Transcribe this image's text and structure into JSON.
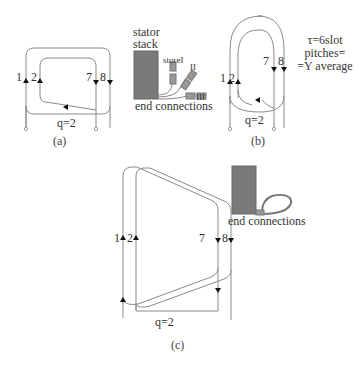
{
  "panel_a": {
    "caption": "(a)",
    "slot_labels": [
      "1",
      "2",
      "7",
      "8"
    ],
    "q_label": "q=2"
  },
  "stator_detail": {
    "title_line1": "stator",
    "title_line2": "stack",
    "store_labels": [
      "storeI",
      "II",
      "III"
    ],
    "end_connections_label": "end connections"
  },
  "panel_b": {
    "caption": "(b)",
    "slot_labels": [
      "1",
      "2",
      "7",
      "8"
    ],
    "q_label": "q=2",
    "note_line1": "τ=6slot",
    "note_line2": "pitches=",
    "note_line3": "=Y average"
  },
  "panel_c": {
    "caption": "(c)",
    "slot_labels": [
      "1",
      "2",
      "7",
      "8"
    ],
    "q_label": "q=2",
    "end_connections_label": "end connections"
  },
  "colors": {
    "line": "#888888",
    "stator_fill": "#7a7a7a",
    "arrow": "#111111"
  }
}
